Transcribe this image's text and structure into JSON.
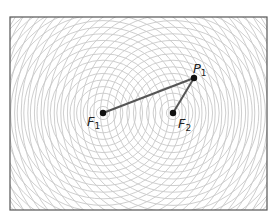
{
  "diagram": {
    "type": "two-source-interference",
    "frame": {
      "x": 10,
      "y": 17,
      "width": 257,
      "height": 193,
      "stroke": "#555555"
    },
    "wave_rings": {
      "spacing": 6.6,
      "count": 40,
      "stroke": "#c8c8c8"
    },
    "colors": {
      "segment": "#555555",
      "point": "#111111",
      "text": "#222222"
    },
    "points": [
      {
        "id": "F1",
        "base": "F",
        "sub": "1",
        "x": 103,
        "y": 113,
        "label_x": 87,
        "label_y": 126
      },
      {
        "id": "F2",
        "base": "F",
        "sub": "2",
        "x": 173,
        "y": 113,
        "label_x": 178,
        "label_y": 128
      },
      {
        "id": "P1",
        "base": "P",
        "sub": "1",
        "x": 194,
        "y": 78,
        "label_x": 193,
        "label_y": 73
      }
    ],
    "segments": [
      {
        "from": "F1",
        "to": "P1"
      },
      {
        "from": "F2",
        "to": "P1"
      }
    ]
  }
}
